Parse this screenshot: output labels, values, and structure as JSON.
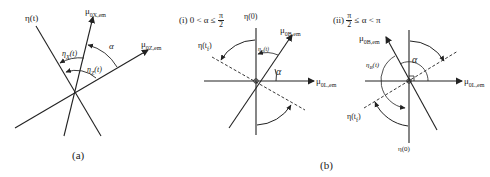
{
  "figure": {
    "panel_a": {
      "caption": "(a)",
      "labels": {
        "eta_t": "η(t)",
        "mu_0x": "μ",
        "mu_0x_sub": "0X,em",
        "mu_0z": "μ",
        "mu_0z_sub": "0Z,em",
        "eta_x": "η",
        "eta_x_sub": "X",
        "eta_x_arg": "(t)",
        "eta_z": "η",
        "eta_z_sub": "Z",
        "eta_z_arg": "(t)",
        "alpha": "α"
      }
    },
    "panel_b": {
      "caption": "(b)",
      "sub_i": {
        "title_prefix": "(i)  0 < α ≤",
        "frac_num": "π",
        "frac_den": "2",
        "labels": {
          "eta_0": "η(0)",
          "eta_tf": "η(t",
          "eta_tf_sub": "f",
          "eta_tf_close": ")",
          "mu_0b": "μ",
          "mu_0b_sub": "0B,em",
          "mu_0l": "μ",
          "mu_0l_sub": "0L,em",
          "eta_b": "η",
          "eta_b_sub": "B",
          "eta_b_arg": "(t)",
          "alpha": "α"
        }
      },
      "sub_ii": {
        "title_prefix": "(ii)",
        "frac_num": "π",
        "frac_den": "2",
        "title_suffix": "≤ α < π",
        "labels": {
          "eta_0": "η(0)",
          "eta_tf": "η(t",
          "eta_tf_sub": "f",
          "eta_tf_close": ")",
          "mu_0b": "μ",
          "mu_0b_sub": "0B,em",
          "mu_0l": "μ",
          "mu_0l_sub": "0L,em",
          "eta_b": "η",
          "eta_b_sub": "B",
          "eta_b_arg": "(t)",
          "alpha": "α"
        }
      }
    },
    "colors": {
      "ink": "#222222",
      "background": "#ffffff"
    }
  }
}
